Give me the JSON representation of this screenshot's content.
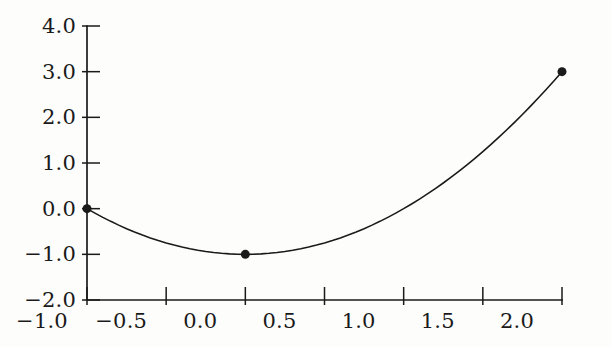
{
  "figure": {
    "background_color": "#fdfdfc",
    "ink_color": "#1a1a1a",
    "width": 612,
    "height": 347
  },
  "chart_data": {
    "type": "line",
    "title": "",
    "subtitle": "",
    "xlabel": "",
    "ylabel": "",
    "xlim": [
      -1.0,
      2.0
    ],
    "ylim": [
      -2.0,
      4.0
    ],
    "grid": false,
    "legend": null,
    "annotations": [],
    "x_ticks": [
      -1.0,
      -0.5,
      0.0,
      0.5,
      1.0,
      1.5,
      2.0
    ],
    "y_ticks": [
      -2.0,
      -1.0,
      0.0,
      1.0,
      2.0,
      3.0,
      4.0
    ],
    "x_tick_labels": [
      "−1.0",
      "−0.5",
      "0.0",
      "0.5",
      "1.0",
      "1.5",
      "2.0"
    ],
    "y_tick_labels": [
      "−2.0",
      "−1.0",
      "0.0",
      "1.0",
      "2.0",
      "3.0",
      "4.0"
    ],
    "series": [
      {
        "name": "y = x^2 - 1",
        "kind": "curve",
        "stroke": "#1a1a1a",
        "linewidth": 1.6,
        "x": [
          -1.0,
          -0.95,
          -0.9,
          -0.85,
          -0.8,
          -0.75,
          -0.7,
          -0.65,
          -0.6,
          -0.55,
          -0.5,
          -0.45,
          -0.4,
          -0.35,
          -0.3,
          -0.25,
          -0.2,
          -0.15,
          -0.1,
          -0.05,
          0.0,
          0.05,
          0.1,
          0.15,
          0.2,
          0.25,
          0.3,
          0.35,
          0.4,
          0.45,
          0.5,
          0.55,
          0.6,
          0.65,
          0.7,
          0.75,
          0.8,
          0.85,
          0.9,
          0.95,
          1.0,
          1.05,
          1.1,
          1.15,
          1.2,
          1.25,
          1.3,
          1.35,
          1.4,
          1.45,
          1.5,
          1.55,
          1.6,
          1.65,
          1.7,
          1.75,
          1.8,
          1.85,
          1.9,
          1.95,
          2.0
        ],
        "y": [
          0.0,
          -0.0975,
          -0.19,
          -0.2775,
          -0.36,
          -0.4375,
          -0.51,
          -0.5775,
          -0.64,
          -0.6975,
          -0.75,
          -0.7975,
          -0.84,
          -0.8775,
          -0.91,
          -0.9375,
          -0.96,
          -0.9775,
          -0.99,
          -0.9975,
          -1.0,
          -0.9975,
          -0.99,
          -0.9775,
          -0.96,
          -0.9375,
          -0.91,
          -0.8775,
          -0.84,
          -0.7975,
          -0.75,
          -0.6975,
          -0.64,
          -0.5775,
          -0.51,
          -0.4375,
          -0.36,
          -0.2775,
          -0.19,
          -0.0975,
          0.0,
          0.1025,
          0.21,
          0.3225,
          0.44,
          0.5625,
          0.69,
          0.8225,
          0.96,
          1.1025,
          1.25,
          1.4025,
          1.56,
          1.7225,
          1.89,
          2.0625,
          2.24,
          2.4225,
          2.61,
          2.8025,
          3.0
        ]
      },
      {
        "name": "marked points",
        "kind": "scatter",
        "marker": "filled-circle",
        "marker_size": 9,
        "fill": "#1a1a1a",
        "points": [
          {
            "x": -1.0,
            "y": 0.0
          },
          {
            "x": 0.0,
            "y": -1.0
          },
          {
            "x": 2.0,
            "y": 3.0
          }
        ]
      }
    ]
  },
  "axes": {
    "spines": {
      "left": true,
      "bottom": true,
      "top": false,
      "right": false
    },
    "tick_direction": "inout",
    "plot_left_px": 87,
    "plot_right_px": 562,
    "plot_top_px": 26,
    "plot_bottom_px": 300
  }
}
